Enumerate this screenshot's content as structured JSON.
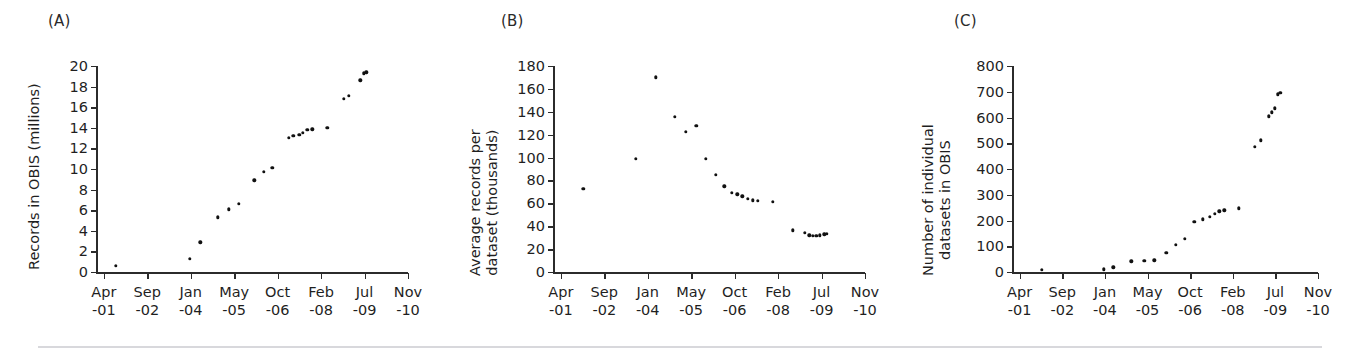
{
  "figure": {
    "background": "#ffffff",
    "marker_color": "#111111",
    "axis_color": "#2b2b2b",
    "footer_rule_color": "#d8d8dc"
  },
  "x_axis": {
    "tick_labels": [
      {
        "month": "Apr",
        "year": "-01"
      },
      {
        "month": "Sep",
        "year": "-02"
      },
      {
        "month": "Jan",
        "year": "-04"
      },
      {
        "month": "May",
        "year": "-05"
      },
      {
        "month": "Oct",
        "year": "-06"
      },
      {
        "month": "Feb",
        "year": "-08"
      },
      {
        "month": "Jul",
        "year": "-09"
      },
      {
        "month": "Nov",
        "year": "-10"
      }
    ],
    "tick_positions": [
      0,
      1,
      2,
      3,
      4,
      5,
      6,
      7
    ],
    "range": [
      -0.18,
      7.0
    ]
  },
  "panels": [
    {
      "id": "A",
      "label": "(A)",
      "ylabel": "Records in OBIS (millions)"
    },
    {
      "id": "B",
      "label": "(B)",
      "ylabel": "Average records per dataset (thousands)",
      "ylabel_lines": [
        "Average records per",
        "dataset (thousands)"
      ]
    },
    {
      "id": "C",
      "label": "(C)",
      "ylabel": "Number of individual datasets in OBIS",
      "ylabel_lines": [
        "Number of individual",
        "datasets in OBIS"
      ]
    }
  ],
  "chart_data": [
    {
      "type": "scatter",
      "panel": "A",
      "title": "(A)",
      "xlabel": "",
      "ylabel": "Records in OBIS (millions)",
      "ylim": [
        0,
        20
      ],
      "yticks": [
        0,
        2,
        4,
        6,
        8,
        10,
        12,
        14,
        16,
        18,
        20
      ],
      "ytick_labels": [
        "0",
        "2",
        "4",
        "6",
        "8",
        "10",
        "12",
        "14",
        "16",
        "18",
        "20"
      ],
      "xlim": [
        -0.18,
        7.0
      ],
      "xticks": [
        0,
        1,
        2,
        3,
        4,
        5,
        6,
        7
      ],
      "xtick_labels": [
        "Apr\n-01",
        "Sep\n-02",
        "Jan\n-04",
        "May\n-05",
        "Oct\n-06",
        "Feb\n-08",
        "Jul\n-09",
        "Nov\n-10"
      ],
      "grid": false,
      "legend": false,
      "x": [
        0.28,
        1.98,
        2.22,
        2.62,
        2.88,
        3.1,
        3.46,
        3.68,
        3.88,
        4.26,
        4.36,
        4.5,
        4.58,
        4.68,
        4.8,
        5.14,
        5.52,
        5.64,
        5.9,
        5.98,
        6.04
      ],
      "y": [
        0.6,
        1.3,
        2.9,
        5.3,
        6.1,
        6.6,
        8.9,
        9.7,
        10.1,
        13.0,
        13.2,
        13.3,
        13.5,
        13.8,
        13.85,
        14.0,
        16.8,
        17.1,
        18.6,
        19.3,
        19.4
      ]
    },
    {
      "type": "scatter",
      "panel": "B",
      "title": "(B)",
      "xlabel": "",
      "ylabel": "Average records per dataset (thousands)",
      "ylim": [
        0,
        180
      ],
      "yticks": [
        0,
        20,
        40,
        60,
        80,
        100,
        120,
        140,
        160,
        180
      ],
      "ytick_labels": [
        "0",
        "20",
        "40",
        "60",
        "80",
        "100",
        "120",
        "140",
        "160",
        "180"
      ],
      "xlim": [
        -0.18,
        7.0
      ],
      "xticks": [
        0,
        1,
        2,
        3,
        4,
        5,
        6,
        7
      ],
      "xtick_labels": [
        "Apr\n-01",
        "Sep\n-02",
        "Jan\n-04",
        "May\n-05",
        "Oct\n-06",
        "Feb\n-08",
        "Jul\n-09",
        "Nov\n-10"
      ],
      "grid": false,
      "legend": false,
      "x": [
        0.52,
        1.72,
        2.18,
        2.62,
        2.88,
        3.12,
        3.34,
        3.56,
        3.76,
        3.94,
        4.06,
        4.18,
        4.3,
        4.42,
        4.54,
        4.88,
        5.34,
        5.62,
        5.72,
        5.8,
        5.88,
        5.96,
        6.06,
        6.12
      ],
      "y": [
        72.5,
        99.0,
        170.0,
        135.5,
        122.5,
        127.5,
        99.0,
        85.0,
        75.0,
        69.0,
        68.0,
        66.0,
        64.0,
        62.5,
        62.0,
        61.5,
        36.5,
        34.0,
        32.0,
        31.5,
        31.5,
        32.0,
        33.0,
        33.5
      ]
    },
    {
      "type": "scatter",
      "panel": "C",
      "title": "(C)",
      "xlabel": "",
      "ylabel": "Number of individual datasets in OBIS",
      "ylim": [
        0,
        800
      ],
      "yticks": [
        0,
        100,
        200,
        300,
        400,
        500,
        600,
        700,
        800
      ],
      "ytick_labels": [
        "0",
        "100",
        "200",
        "300",
        "400",
        "500",
        "600",
        "700",
        "800"
      ],
      "xlim": [
        -0.18,
        7.0
      ],
      "xticks": [
        0,
        1,
        2,
        3,
        4,
        5,
        6,
        7
      ],
      "xtick_labels": [
        "Apr\n-01",
        "Sep\n-02",
        "Jan\n-04",
        "May\n-05",
        "Oct\n-06",
        "Feb\n-08",
        "Jul\n-09",
        "Nov\n-10"
      ],
      "grid": false,
      "legend": false,
      "x": [
        0.52,
        1.98,
        2.2,
        2.62,
        2.92,
        3.16,
        3.44,
        3.66,
        3.88,
        4.1,
        4.3,
        4.46,
        4.58,
        4.68,
        4.8,
        5.14,
        5.52,
        5.66,
        5.84,
        5.92,
        5.98,
        6.06,
        6.12
      ],
      "y": [
        8,
        10,
        18,
        42,
        44,
        45,
        75,
        105,
        130,
        195,
        205,
        215,
        225,
        235,
        240,
        248,
        487,
        512,
        605,
        620,
        635,
        690,
        695
      ]
    }
  ]
}
